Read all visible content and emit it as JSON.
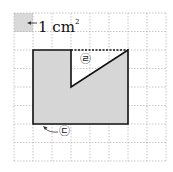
{
  "diagram": {
    "unit_label": "1 cm",
    "unit_exponent": "2",
    "marker_e": "㉣",
    "marker_c": "㉢",
    "colors": {
      "grid": "#b8b8b8",
      "unit_square": "#d9d9d9",
      "shape_fill": "#d6d6d6",
      "outline": "#111111"
    },
    "grid": {
      "columns": 8,
      "rows": 8,
      "cell_cm": 1
    }
  }
}
